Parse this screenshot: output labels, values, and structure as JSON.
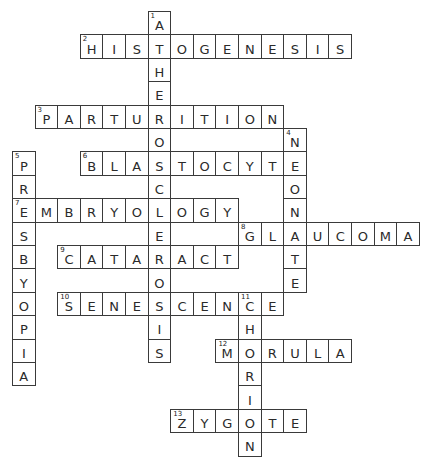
{
  "puzzle": {
    "grid": {
      "origin_x": 12,
      "origin_y": 11,
      "cell_w": 22.6,
      "cell_h": 23.4
    },
    "colors": {
      "border": "#3a3a3a",
      "text": "#2a2a2a",
      "background": "#ffffff"
    },
    "entries": [
      {
        "number": 1,
        "direction": "down",
        "answer": "ATHEROSCLEROSIS",
        "col": 6,
        "row": 0
      },
      {
        "number": 2,
        "direction": "across",
        "answer": "HISTOGENESIS",
        "col": 3,
        "row": 1
      },
      {
        "number": 3,
        "direction": "across",
        "answer": "PARTURITION",
        "col": 1,
        "row": 4
      },
      {
        "number": 4,
        "direction": "down",
        "answer": "NEONATE",
        "col": 12,
        "row": 5
      },
      {
        "number": 5,
        "direction": "down",
        "answer": "PRESBYOPIA",
        "col": 0,
        "row": 6
      },
      {
        "number": 6,
        "direction": "across",
        "answer": "BLASTOCYTE",
        "col": 3,
        "row": 6
      },
      {
        "number": 7,
        "direction": "across",
        "answer": "EMBRYOLOGY",
        "col": 0,
        "row": 8
      },
      {
        "number": 8,
        "direction": "across",
        "answer": "GLAUCOMA",
        "col": 10,
        "row": 9
      },
      {
        "number": 9,
        "direction": "across",
        "answer": "CATARACT",
        "col": 2,
        "row": 10
      },
      {
        "number": 10,
        "direction": "across",
        "answer": "SENESCENCE",
        "col": 2,
        "row": 12
      },
      {
        "number": 11,
        "direction": "down",
        "answer": "CHORION",
        "col": 10,
        "row": 12
      },
      {
        "number": 12,
        "direction": "across",
        "answer": "MORULA",
        "col": 9,
        "row": 14
      },
      {
        "number": 13,
        "direction": "across",
        "answer": "ZYGOTE",
        "col": 7,
        "row": 17
      }
    ]
  }
}
